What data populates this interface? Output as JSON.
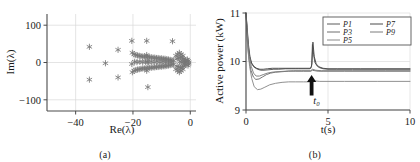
{
  "figure": {
    "panels": [
      {
        "id": "a",
        "caption": "(a)"
      },
      {
        "id": "b",
        "caption": "(b)"
      }
    ]
  },
  "chart_data": [
    {
      "type": "scatter",
      "panel": "(a)",
      "title": "",
      "xlabel": "Re(λ)",
      "ylabel": "Im(λ)",
      "xlim": [
        -50,
        2
      ],
      "ylim": [
        -130,
        130
      ],
      "xticks": [
        -40,
        -20,
        0
      ],
      "xticklabels": [
        "−40",
        "−20",
        "0"
      ],
      "yticks": [
        -100,
        0,
        100
      ],
      "yticklabels": [
        "−100",
        "0",
        "100"
      ],
      "grid": true,
      "marker": "asterisk",
      "marker_color": "#777777",
      "legend": null,
      "points": [
        [
          -35.2,
          42
        ],
        [
          -35.2,
          -46
        ],
        [
          -29.6,
          -2
        ],
        [
          -25.2,
          34
        ],
        [
          -25.2,
          -40
        ],
        [
          -20.4,
          58
        ],
        [
          -20.2,
          26
        ],
        [
          -20.2,
          -26
        ],
        [
          -20.4,
          -4
        ],
        [
          -15.2,
          58
        ],
        [
          -14.8,
          -66
        ],
        [
          -15.0,
          2
        ],
        [
          -15.2,
          20
        ],
        [
          -15.2,
          -22
        ],
        [
          -6.2,
          57
        ],
        [
          -19.6,
          22
        ],
        [
          -19.0,
          20
        ],
        [
          -18.4,
          19
        ],
        [
          -17.8,
          18
        ],
        [
          -17.2,
          17
        ],
        [
          -16.6,
          16
        ],
        [
          -16.0,
          16
        ],
        [
          -15.4,
          15
        ],
        [
          -14.8,
          15
        ],
        [
          -14.2,
          14
        ],
        [
          -13.6,
          14
        ],
        [
          -13.0,
          13
        ],
        [
          -12.4,
          13
        ],
        [
          -11.8,
          12
        ],
        [
          -11.2,
          12
        ],
        [
          -10.6,
          11
        ],
        [
          -10.0,
          11
        ],
        [
          -9.4,
          10
        ],
        [
          -8.8,
          10
        ],
        [
          -8.2,
          9
        ],
        [
          -7.6,
          8
        ],
        [
          -7.0,
          7
        ],
        [
          -6.4,
          6
        ],
        [
          -5.8,
          5
        ],
        [
          -19.6,
          -22
        ],
        [
          -19.0,
          -20
        ],
        [
          -18.4,
          -19
        ],
        [
          -17.8,
          -18
        ],
        [
          -17.2,
          -17
        ],
        [
          -16.6,
          -16
        ],
        [
          -16.0,
          -16
        ],
        [
          -15.4,
          -15
        ],
        [
          -14.8,
          -15
        ],
        [
          -14.2,
          -14
        ],
        [
          -13.6,
          -14
        ],
        [
          -13.0,
          -13
        ],
        [
          -12.4,
          -13
        ],
        [
          -11.8,
          -12
        ],
        [
          -11.2,
          -12
        ],
        [
          -10.6,
          -11
        ],
        [
          -10.0,
          -11
        ],
        [
          -9.4,
          -10
        ],
        [
          -8.8,
          -10
        ],
        [
          -8.2,
          -9
        ],
        [
          -7.6,
          -8
        ],
        [
          -7.0,
          -7
        ],
        [
          -6.4,
          -6
        ],
        [
          -5.8,
          -5
        ],
        [
          -19.4,
          2
        ],
        [
          -18.6,
          1
        ],
        [
          -17.6,
          2
        ],
        [
          -16.6,
          1
        ],
        [
          -15.6,
          2
        ],
        [
          -14.6,
          1
        ],
        [
          -13.6,
          2
        ],
        [
          -12.6,
          1
        ],
        [
          -11.6,
          2
        ],
        [
          -10.6,
          1
        ],
        [
          -9.6,
          2
        ],
        [
          -8.6,
          1
        ],
        [
          -7.6,
          2
        ],
        [
          -6.6,
          1
        ],
        [
          -5.0,
          18
        ],
        [
          -4.4,
          22
        ],
        [
          -3.8,
          26
        ],
        [
          -3.2,
          22
        ],
        [
          -2.6,
          18
        ],
        [
          -5.0,
          -18
        ],
        [
          -4.4,
          -22
        ],
        [
          -3.8,
          -26
        ],
        [
          -3.2,
          -22
        ],
        [
          -2.6,
          -18
        ],
        [
          -4.6,
          10
        ],
        [
          -4.0,
          12
        ],
        [
          -3.4,
          14
        ],
        [
          -2.8,
          12
        ],
        [
          -2.2,
          10
        ],
        [
          -4.6,
          -10
        ],
        [
          -4.0,
          -12
        ],
        [
          -3.4,
          -14
        ],
        [
          -2.8,
          -12
        ],
        [
          -2.2,
          -10
        ],
        [
          -3.6,
          2
        ],
        [
          -3.0,
          1
        ],
        [
          -2.4,
          2
        ],
        [
          -1.8,
          1
        ],
        [
          -1.2,
          2
        ],
        [
          -1.0,
          8
        ],
        [
          -0.8,
          -8
        ],
        [
          -0.7,
          4
        ],
        [
          -0.6,
          -4
        ],
        [
          -0.5,
          0
        ],
        [
          -1.6,
          6
        ],
        [
          -1.6,
          -6
        ],
        [
          -2.0,
          4
        ],
        [
          -2.0,
          -4
        ]
      ]
    },
    {
      "type": "line",
      "panel": "(b)",
      "title": "",
      "xlabel": "t(s)",
      "ylabel": "Active power (kW)",
      "xlim": [
        0,
        10
      ],
      "ylim": [
        9,
        11
      ],
      "xticks": [
        0,
        5,
        10
      ],
      "xticklabels": [
        "0",
        "5",
        "10"
      ],
      "yticks": [
        9,
        10,
        11
      ],
      "yticklabels": [
        "9",
        "10",
        "11"
      ],
      "grid": true,
      "legend_position": "top-right",
      "annotations": [
        {
          "name": "t0-arrow",
          "label": "t₀",
          "x": 4.0,
          "type": "up-arrow"
        }
      ],
      "series": [
        {
          "name": "P1",
          "color": "#5a5a5a",
          "x": [
            0,
            0.08,
            0.16,
            0.25,
            0.35,
            0.5,
            0.7,
            0.9,
            1.1,
            1.4,
            1.7,
            2.0,
            2.4,
            2.8,
            3.2,
            3.6,
            3.9,
            4.0,
            4.05,
            4.12,
            4.2,
            4.35,
            4.5,
            4.7,
            5.0,
            5.5,
            6.5,
            8.0,
            10.0
          ],
          "y": [
            11.0,
            10.6,
            10.25,
            10.05,
            9.95,
            9.88,
            9.84,
            9.82,
            9.82,
            9.83,
            9.84,
            9.84,
            9.85,
            9.85,
            9.85,
            9.85,
            9.85,
            9.9,
            10.35,
            10.15,
            9.98,
            9.9,
            9.87,
            9.85,
            9.84,
            9.84,
            9.84,
            9.84,
            9.84
          ]
        },
        {
          "name": "P3",
          "color": "#6e6e6e",
          "x": [
            0,
            0.08,
            0.18,
            0.3,
            0.45,
            0.6,
            0.8,
            1.0,
            1.25,
            1.5,
            1.8,
            2.2,
            2.6,
            3.0,
            3.5,
            3.95,
            4.05,
            4.2,
            4.4,
            4.7,
            5.0,
            6.0,
            7.5,
            10.0
          ],
          "y": [
            11.0,
            10.45,
            10.05,
            9.82,
            9.68,
            9.63,
            9.64,
            9.68,
            9.73,
            9.76,
            9.78,
            9.79,
            9.8,
            9.8,
            9.8,
            9.8,
            9.82,
            9.81,
            9.8,
            9.8,
            9.8,
            9.8,
            9.8,
            9.8
          ]
        },
        {
          "name": "P5",
          "color": "#8a8a8a",
          "x": [
            0,
            0.1,
            0.22,
            0.35,
            0.5,
            0.7,
            0.9,
            1.15,
            1.45,
            1.8,
            2.2,
            2.6,
            3.0,
            3.5,
            3.95,
            4.05,
            4.2,
            4.5,
            5.0,
            6.0,
            8.0,
            10.0
          ],
          "y": [
            11.0,
            10.3,
            9.9,
            9.65,
            9.48,
            9.42,
            9.43,
            9.47,
            9.52,
            9.55,
            9.57,
            9.58,
            9.58,
            9.58,
            9.58,
            9.62,
            9.6,
            9.59,
            9.59,
            9.59,
            9.59,
            9.59
          ]
        },
        {
          "name": "P7",
          "color": "#4a4a4a",
          "x": [
            0,
            0.07,
            0.15,
            0.24,
            0.34,
            0.48,
            0.65,
            0.85,
            1.05,
            1.3,
            1.6,
            2.0,
            2.5,
            3.0,
            3.6,
            3.95,
            4.02,
            4.08,
            4.16,
            4.28,
            4.45,
            4.7,
            5.0,
            5.6,
            7.0,
            10.0
          ],
          "y": [
            11.0,
            10.7,
            10.35,
            10.1,
            9.97,
            9.9,
            9.86,
            9.84,
            9.84,
            9.85,
            9.86,
            9.86,
            9.86,
            9.86,
            9.86,
            9.86,
            9.95,
            10.4,
            10.1,
            9.95,
            9.89,
            9.86,
            9.85,
            9.85,
            9.85,
            9.85
          ]
        },
        {
          "name": "P9",
          "color": "#7d7d7d",
          "x": [
            0,
            0.09,
            0.2,
            0.32,
            0.46,
            0.62,
            0.82,
            1.05,
            1.3,
            1.6,
            1.95,
            2.4,
            2.9,
            3.4,
            3.95,
            4.05,
            4.25,
            4.6,
            5.0,
            6.5,
            8.5,
            10.0
          ],
          "y": [
            11.0,
            10.5,
            10.12,
            9.9,
            9.76,
            9.7,
            9.7,
            9.73,
            9.76,
            9.78,
            9.79,
            9.8,
            9.81,
            9.81,
            9.81,
            9.84,
            9.82,
            9.81,
            9.81,
            9.81,
            9.81,
            9.81
          ]
        }
      ]
    }
  ]
}
